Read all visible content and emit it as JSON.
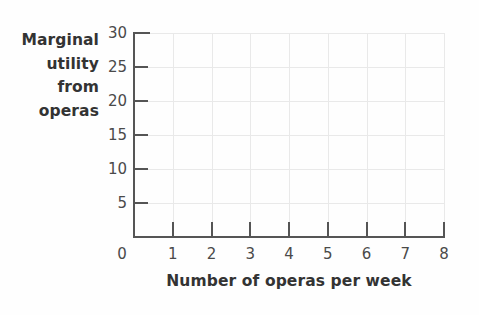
{
  "chart_data": {
    "type": "line",
    "title": "",
    "xlabel": "Number of operas per week",
    "ylabel": "Marginal utility from operas",
    "ylabel_lines": [
      "Marginal",
      "utility",
      "from",
      "operas"
    ],
    "x": [],
    "values": [],
    "series": [],
    "xlim": [
      0,
      8
    ],
    "ylim": [
      0,
      30
    ],
    "xticks": [
      0,
      1,
      2,
      3,
      4,
      5,
      6,
      7,
      8
    ],
    "xtick_labels": [
      "0",
      "1",
      "2",
      "3",
      "4",
      "5",
      "6",
      "7",
      "8"
    ],
    "yticks": [
      5,
      10,
      15,
      20,
      25,
      30
    ],
    "ytick_labels": [
      "5",
      "10",
      "15",
      "20",
      "25",
      "30"
    ],
    "grid": true,
    "legend": false,
    "legend_position": "none",
    "annotations": [],
    "note": "Empty plotting grid — no data series plotted",
    "colors": {
      "axis": "#555555",
      "grid": "#e9e9e9",
      "text": "#3a3a3a",
      "background": "#fefefe"
    }
  }
}
